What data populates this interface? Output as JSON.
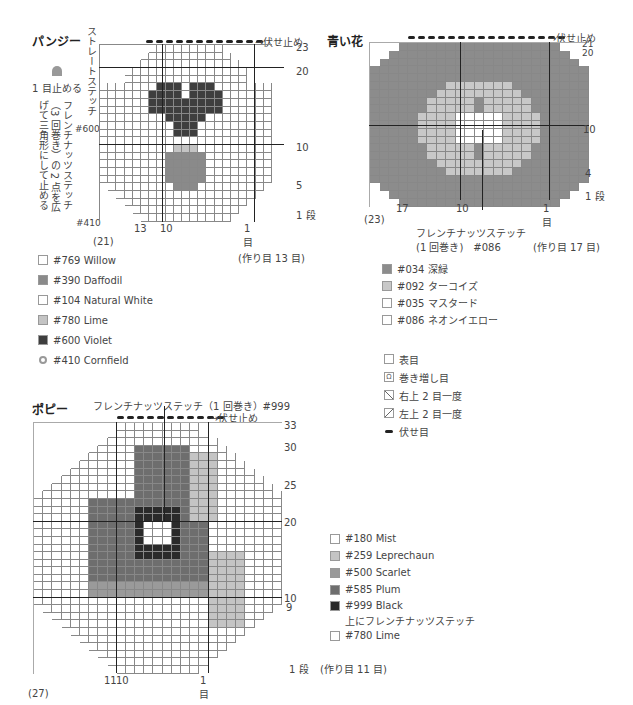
{
  "pansy": {
    "title": "パンジー",
    "bind_off": "→伏せ止め",
    "straight_stitch": "ストレートステッチ",
    "straight_color": "#600",
    "stop_one": "1 目止める",
    "french_knot": "フレンチナッツステッチ（3 回巻き）の 2 点を広げて三角形にして止める",
    "french_knot_color": "#410",
    "rows": [
      "23",
      "20",
      "10",
      "5",
      "1 段"
    ],
    "cols": [
      "13",
      "10",
      "1"
    ],
    "col_unit": "目",
    "total": "(21)",
    "cast_on": "(作り目 13 目)",
    "legend": [
      {
        "label": "#769 Willow",
        "color": "#ffffff"
      },
      {
        "label": "#390 Daffodil",
        "color": "#8a8a8a"
      },
      {
        "label": "#104 Natural White",
        "color": "#ffffff"
      },
      {
        "label": "#780 Lime",
        "color": "#c4c4c4"
      },
      {
        "label": "#600 Violet",
        "color": "#3e3e3e"
      },
      {
        "label": "#410 Cornfield",
        "color": "#999999"
      }
    ]
  },
  "blue_flower": {
    "title": "青い花",
    "bind_off": "→伏せ止め",
    "rows": [
      "21",
      "20",
      "10",
      "4",
      "1 段"
    ],
    "cols": [
      "17",
      "10",
      "1"
    ],
    "col_unit": "目",
    "total": "(23)",
    "cast_on": "(作り目 17 目)",
    "french_knot": "フレンチナッツステッチ",
    "french_knot_detail": "(1 回巻き)　#086",
    "legend": [
      {
        "label": "#034 深緑",
        "color": "#8c8c8c"
      },
      {
        "label": "#092 ターコイズ",
        "color": "#c8c8c8"
      },
      {
        "label": "#035 マスタード",
        "color": "#ffffff"
      },
      {
        "label": "#086 ネオンイエロー",
        "color": "#ffffff"
      }
    ]
  },
  "symbols": [
    {
      "label": "表目",
      "icon": "knit-symbol"
    },
    {
      "label": "巻き増し目",
      "icon": "wrap-increase-symbol"
    },
    {
      "label": "右上 2 目一度",
      "icon": "right-decrease-symbol"
    },
    {
      "label": "左上 2 目一度",
      "icon": "left-decrease-symbol"
    },
    {
      "label": "伏せ目",
      "icon": "bind-off-symbol"
    }
  ],
  "poppy": {
    "title": "ポピー",
    "french_knot": "フレンチナッツステッチ（1 回巻き）#999",
    "bind_off": "→伏せ止め",
    "rows": [
      "33",
      "30",
      "25",
      "20",
      "10",
      "9",
      "1 段"
    ],
    "cols": [
      "11",
      "10",
      "1"
    ],
    "col_unit": "目",
    "total": "(27)",
    "cast_on": "(作り目 11 目)",
    "legend": [
      {
        "label": "#180 Mist",
        "color": "#ffffff"
      },
      {
        "label": "#259 Leprechaun",
        "color": "#c4c4c4"
      },
      {
        "label": "#500 Scarlet",
        "color": "#9a9a9a"
      },
      {
        "label": "#585 Plum",
        "color": "#6e6e6e"
      },
      {
        "label": "#999 Black",
        "color": "#2a2a2a"
      },
      {
        "label": "上にフレンチナッツステッチ",
        "color": null
      },
      {
        "label": "#780 Lime",
        "color": "#ffffff"
      }
    ]
  }
}
